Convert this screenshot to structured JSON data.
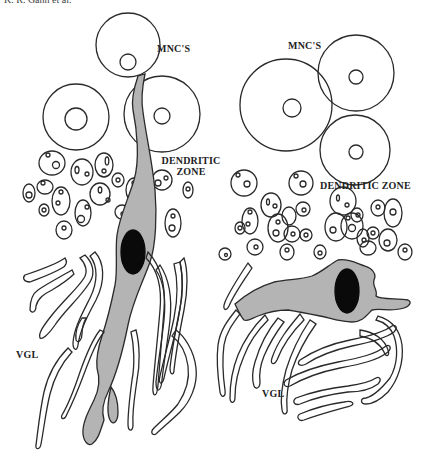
{
  "header": {
    "text": "K. R. Gann et al."
  },
  "figure": {
    "left_panel": {
      "labels": {
        "mnc": "MNC'S",
        "dendritic_line1": "DENDRITIC",
        "dendritic_line2": "ZONE",
        "vgl": "VGL"
      }
    },
    "right_panel": {
      "labels": {
        "mnc": "MNC'S",
        "dendritic": "DENDRITIC ZONE",
        "vgl": "VGL"
      }
    }
  },
  "colors": {
    "stroke": "#2a2a2a",
    "cell_fill": "#b4b4b4",
    "nucleus": "#0a0a0a",
    "background": "#ffffff"
  }
}
